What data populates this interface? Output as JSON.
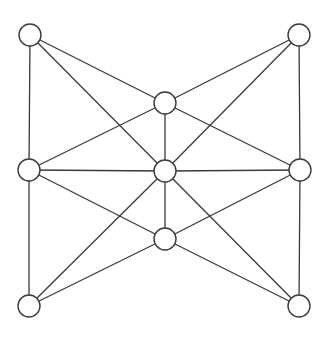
{
  "diagram": {
    "type": "graph",
    "colors": {
      "stroke": "#3a3a3a",
      "node_fill": "#ffffff",
      "background": "#ffffff"
    },
    "node_radius": 11,
    "nodes": [
      {
        "id": "TL",
        "x": 30,
        "y": 35
      },
      {
        "id": "TR",
        "x": 299,
        "y": 35
      },
      {
        "id": "TM",
        "x": 165,
        "y": 103
      },
      {
        "id": "ML",
        "x": 29,
        "y": 170
      },
      {
        "id": "C",
        "x": 165,
        "y": 171
      },
      {
        "id": "MR",
        "x": 300,
        "y": 170
      },
      {
        "id": "BM",
        "x": 165,
        "y": 239
      },
      {
        "id": "BL",
        "x": 29,
        "y": 306
      },
      {
        "id": "BR",
        "x": 299,
        "y": 306
      }
    ],
    "edges": [
      [
        "TL",
        "ML"
      ],
      [
        "ML",
        "BL"
      ],
      [
        "TR",
        "MR"
      ],
      [
        "MR",
        "BR"
      ],
      [
        "TL",
        "TM"
      ],
      [
        "TL",
        "C"
      ],
      [
        "TR",
        "TM"
      ],
      [
        "TR",
        "C"
      ],
      [
        "BL",
        "BM"
      ],
      [
        "BL",
        "C"
      ],
      [
        "BR",
        "BM"
      ],
      [
        "BR",
        "C"
      ],
      [
        "ML",
        "C"
      ],
      [
        "C",
        "MR"
      ],
      [
        "TM",
        "C"
      ],
      [
        "C",
        "BM"
      ],
      [
        "ML",
        "TM"
      ],
      [
        "ML",
        "BM"
      ],
      [
        "TM",
        "MR"
      ],
      [
        "BM",
        "MR"
      ]
    ]
  }
}
